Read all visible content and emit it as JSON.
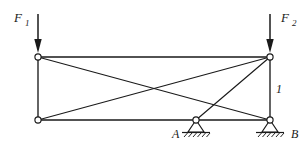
{
  "figure": {
    "kind": "statics-truss-free-body-diagram",
    "background_color": "#ffffff",
    "line_color": "#1a1a1a"
  },
  "loads": [
    {
      "id": "F1",
      "label": "F",
      "subscript": "1",
      "direction": "down",
      "label_x": 14,
      "label_y": 22,
      "sub_x": 25,
      "sub_y": 26,
      "shaft_x": 38,
      "shaft_y_top": 14,
      "shaft_y_bottom": 48,
      "applied_at_joint": "top-left"
    },
    {
      "id": "F2",
      "label": "F",
      "subscript": "2",
      "direction": "down",
      "label_x": 281,
      "label_y": 22,
      "sub_x": 292,
      "sub_y": 26,
      "shaft_x": 270,
      "shaft_y_top": 14,
      "shaft_y_bottom": 48,
      "applied_at_joint": "top-right"
    }
  ],
  "joints": [
    {
      "id": "top-left",
      "x": 38,
      "y": 57,
      "r": 3.1
    },
    {
      "id": "top-right",
      "x": 270,
      "y": 57,
      "r": 3.1
    },
    {
      "id": "bottom-left",
      "x": 38,
      "y": 120,
      "r": 3.1
    },
    {
      "id": "support-a",
      "x": 196,
      "y": 120,
      "r": 3.1
    },
    {
      "id": "support-b",
      "x": 270,
      "y": 120,
      "r": 3.1
    }
  ],
  "members": [
    {
      "id": "top-chord",
      "from": "top-left",
      "to": "top-right",
      "style": "chord"
    },
    {
      "id": "bottom-chord",
      "from": "bottom-left",
      "to": "support-b",
      "style": "chord"
    },
    {
      "id": "left-post",
      "from": "top-left",
      "to": "bottom-left",
      "style": "chord"
    },
    {
      "id": "right-post",
      "from": "top-right",
      "to": "support-b",
      "style": "chord"
    },
    {
      "id": "diagonal-tl-br",
      "from": "top-left",
      "to": "support-b",
      "style": "member"
    },
    {
      "id": "diagonal-bl-tr",
      "from": "bottom-left",
      "to": "top-right",
      "style": "member"
    },
    {
      "id": "diagonal-tr-a",
      "from": "top-right",
      "to": "support-a",
      "style": "member"
    }
  ],
  "member_labels": [
    {
      "id": "member-1",
      "text": "1",
      "x": 276,
      "y": 93
    }
  ],
  "supports": [
    {
      "id": "support-a",
      "label": "A",
      "type": "pinned",
      "apex_x": 196,
      "apex_y": 120,
      "half_width": 8,
      "height": 12,
      "ground_y": 132,
      "ground_x1": 182,
      "ground_x2": 210,
      "label_x": 172,
      "label_y": 138,
      "hatch_count": 6
    },
    {
      "id": "support-b",
      "label": "B",
      "type": "pinned",
      "apex_x": 270,
      "apex_y": 120,
      "half_width": 8,
      "height": 12,
      "ground_y": 132,
      "ground_x1": 256,
      "ground_x2": 284,
      "label_x": 291,
      "label_y": 138,
      "hatch_count": 6
    }
  ]
}
